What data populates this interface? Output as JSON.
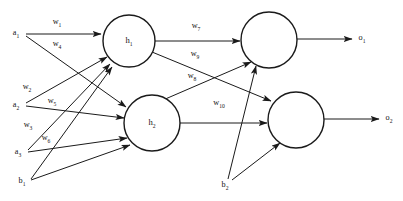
{
  "diagram": {
    "type": "neural-network",
    "background_color": "#ffffff",
    "line_color": "#1a1a1a",
    "text_color": "#141414",
    "canvas": {
      "width": 403,
      "height": 201
    }
  },
  "input_layer": {
    "nodes": [
      {
        "id": "a1",
        "base": "a",
        "sub": "1",
        "x": 16,
        "y": 33
      },
      {
        "id": "a2",
        "base": "a",
        "sub": "2",
        "x": 16,
        "y": 105
      },
      {
        "id": "a3",
        "base": "a",
        "sub": "3",
        "x": 18,
        "y": 152
      },
      {
        "id": "b1",
        "base": "b",
        "sub": "1",
        "x": 22,
        "y": 181
      }
    ]
  },
  "hidden_layer": {
    "nodes": [
      {
        "id": "h1",
        "base": "h",
        "sub": "1",
        "cx": 129,
        "cy": 41,
        "r": 26
      },
      {
        "id": "h2",
        "base": "h",
        "sub": "2",
        "cx": 152,
        "cy": 123,
        "r": 28
      }
    ]
  },
  "output_layer": {
    "nodes": [
      {
        "id": "n1",
        "cx": 269,
        "cy": 40,
        "r": 28
      },
      {
        "id": "n2",
        "cx": 296,
        "cy": 120,
        "r": 28
      }
    ],
    "bias": {
      "id": "b2",
      "base": "b",
      "sub": "2",
      "x": 225,
      "y": 185
    },
    "outputs": [
      {
        "id": "o1",
        "base": "o",
        "sub": "1",
        "x": 362,
        "y": 38
      },
      {
        "id": "o2",
        "base": "o",
        "sub": "2",
        "x": 389,
        "y": 118
      }
    ]
  },
  "weights": [
    {
      "id": "w1",
      "base": "w",
      "sub": "1",
      "x": 57,
      "y": 22
    },
    {
      "id": "w4",
      "base": "w",
      "sub": "4",
      "x": 57,
      "y": 44
    },
    {
      "id": "w2",
      "base": "w",
      "sub": "2",
      "x": 27,
      "y": 87
    },
    {
      "id": "w5",
      "base": "w",
      "sub": "5",
      "x": 52,
      "y": 101
    },
    {
      "id": "w3",
      "base": "w",
      "sub": "3",
      "x": 28,
      "y": 125
    },
    {
      "id": "w6",
      "base": "w",
      "sub": "6",
      "x": 46,
      "y": 138
    },
    {
      "id": "w7",
      "base": "w",
      "sub": "7",
      "x": 196,
      "y": 26
    },
    {
      "id": "w9",
      "base": "w",
      "sub": "9",
      "x": 195,
      "y": 54
    },
    {
      "id": "w8",
      "base": "w",
      "sub": "8",
      "x": 192,
      "y": 76
    },
    {
      "id": "w10",
      "base": "w",
      "sub": "10",
      "x": 219,
      "y": 103
    }
  ],
  "edges": [
    {
      "id": "a1-h1",
      "from": "a1",
      "to": "h1",
      "label": "w1",
      "x1": 26,
      "y1": 34,
      "x2": 101,
      "y2": 34
    },
    {
      "id": "a1-h2",
      "from": "a1",
      "to": "h2",
      "label": "w4",
      "x1": 26,
      "y1": 36,
      "x2": 126,
      "y2": 107
    },
    {
      "id": "a2-h1",
      "from": "a2",
      "to": "h1",
      "label": "w2",
      "x1": 26,
      "y1": 103,
      "x2": 107,
      "y2": 57
    },
    {
      "id": "a2-h2",
      "from": "a2",
      "to": "h2",
      "label": "w5",
      "x1": 26,
      "y1": 106,
      "x2": 124,
      "y2": 118
    },
    {
      "id": "a3-h1",
      "from": "a3",
      "to": "h1",
      "label": "w3",
      "x1": 28,
      "y1": 150,
      "x2": 110,
      "y2": 64
    },
    {
      "id": "a3-h2",
      "from": "a3",
      "to": "h2",
      "label": "w6",
      "x1": 28,
      "y1": 152,
      "x2": 127,
      "y2": 138
    },
    {
      "id": "b1-h1",
      "from": "b1",
      "to": "h1",
      "label": "",
      "x1": 31,
      "y1": 179,
      "x2": 112,
      "y2": 67
    },
    {
      "id": "b1-h2",
      "from": "b1",
      "to": "h2",
      "label": "",
      "x1": 31,
      "y1": 180,
      "x2": 130,
      "y2": 145
    },
    {
      "id": "h1-n1",
      "from": "h1",
      "to": "n1",
      "label": "w7",
      "x1": 155,
      "y1": 41,
      "x2": 240,
      "y2": 41
    },
    {
      "id": "h1-n2",
      "from": "h1",
      "to": "n2",
      "label": "w9",
      "x1": 152,
      "y1": 52,
      "x2": 271,
      "y2": 101
    },
    {
      "id": "h2-n1",
      "from": "h2",
      "to": "n1",
      "label": "w8",
      "x1": 163,
      "y1": 100,
      "x2": 251,
      "y2": 62
    },
    {
      "id": "h2-n2",
      "from": "h2",
      "to": "n2",
      "label": "w10",
      "x1": 180,
      "y1": 123,
      "x2": 267,
      "y2": 123
    },
    {
      "id": "b2-n1",
      "from": "b2",
      "to": "n1",
      "label": "",
      "x1": 228,
      "y1": 179,
      "x2": 256,
      "y2": 66
    },
    {
      "id": "b2-n2",
      "from": "b2",
      "to": "n2",
      "label": "",
      "x1": 232,
      "y1": 180,
      "x2": 280,
      "y2": 143
    },
    {
      "id": "n1-o1",
      "from": "n1",
      "to": "o1",
      "label": "",
      "x1": 297,
      "y1": 39,
      "x2": 352,
      "y2": 39
    },
    {
      "id": "n2-o2",
      "from": "n2",
      "to": "o2",
      "label": "",
      "x1": 324,
      "y1": 119,
      "x2": 379,
      "y2": 119
    }
  ]
}
